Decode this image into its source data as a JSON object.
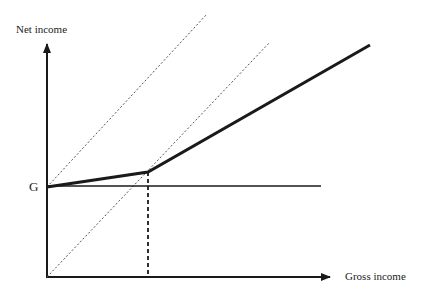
{
  "diagram": {
    "y_axis_label": "Net income",
    "x_axis_label": "Gross income",
    "intercept_label": "G",
    "colors": {
      "line": "#1a1a1a",
      "dashed": "#555555",
      "background": "#ffffff"
    },
    "elements": [
      {
        "name": "net-income-schedule",
        "style": "thick solid",
        "description": "kinked line starting at G, shallow slope then steeper slope"
      },
      {
        "name": "guarantee-line",
        "style": "solid horizontal",
        "description": "horizontal line at G"
      },
      {
        "name": "45-degree-line-from-origin",
        "style": "dotted"
      },
      {
        "name": "45-degree-line-from-G",
        "style": "dotted"
      },
      {
        "name": "kink-dropline",
        "style": "dashed vertical"
      }
    ]
  }
}
